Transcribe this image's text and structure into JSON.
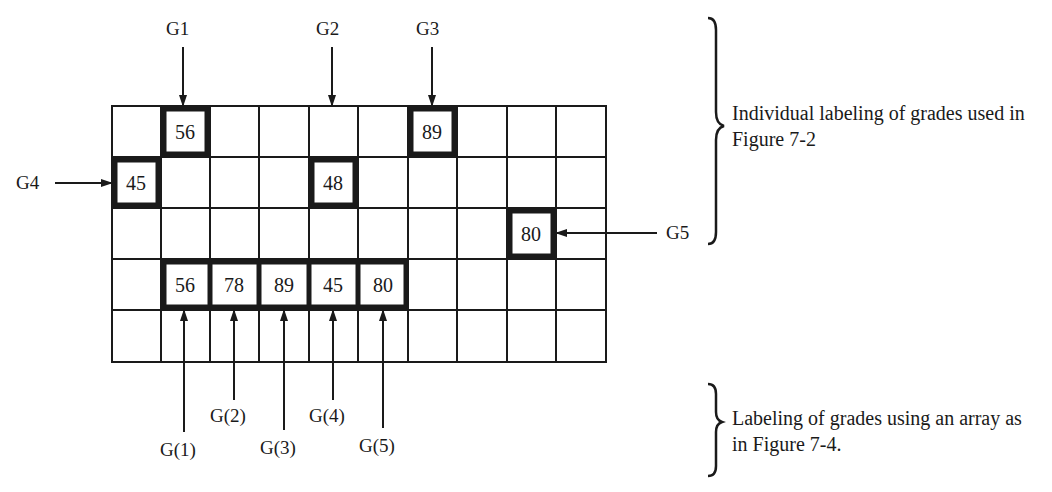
{
  "grid": {
    "rows": 5,
    "cols": 10,
    "highlighted_cells": [
      {
        "row": 0,
        "col": 1,
        "value": "56"
      },
      {
        "row": 0,
        "col": 6,
        "value": "89"
      },
      {
        "row": 1,
        "col": 0,
        "value": "45"
      },
      {
        "row": 1,
        "col": 4,
        "value": "48"
      },
      {
        "row": 2,
        "col": 8,
        "value": "80"
      },
      {
        "row": 3,
        "col": 1,
        "value": "56"
      },
      {
        "row": 3,
        "col": 2,
        "value": "78"
      },
      {
        "row": 3,
        "col": 3,
        "value": "89"
      },
      {
        "row": 3,
        "col": 4,
        "value": "45"
      },
      {
        "row": 3,
        "col": 5,
        "value": "80"
      }
    ]
  },
  "individual_labels": [
    "G1",
    "G2",
    "G3",
    "G4",
    "G5"
  ],
  "array_labels": [
    "G(1)",
    "G(2)",
    "G(3)",
    "G(4)",
    "G(5)"
  ],
  "notes": {
    "individual": "Individual labeling of grades used in Figure 7-2",
    "array": "Labeling of grades using an array as in Figure 7-4."
  }
}
